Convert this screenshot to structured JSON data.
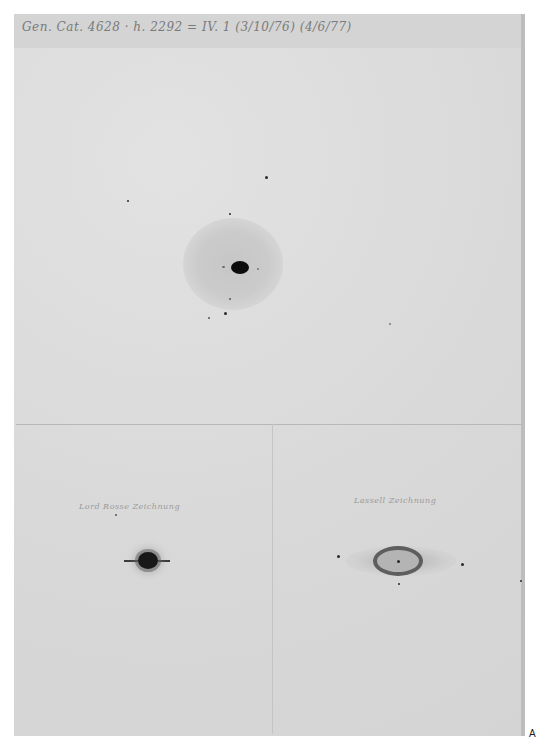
{
  "document": {
    "type": "scanned astronomical plate drawing sheet",
    "header_inscription": "Gen. Cat. 4628 · h. 2292 = IV. 1 (3/10/76) (4/6/77)",
    "header_note": "handwritten, approximate transcription",
    "panels": [
      {
        "id": "top",
        "label": "",
        "description": "Central dark star with diffuse grey halo and small surrounding field stars"
      },
      {
        "id": "bottom-left",
        "label": "Lord Rosse Zeichnung",
        "label_note": "approximate transcription",
        "description": "Dark disc with radiating spikes and horizontal streak"
      },
      {
        "id": "bottom-right",
        "label": "Lassell Zeichnung",
        "label_note": "approximate transcription",
        "description": "Elliptical ring nebula with central star and faint fan-shaped extensions"
      }
    ],
    "corner_mark": "A"
  }
}
